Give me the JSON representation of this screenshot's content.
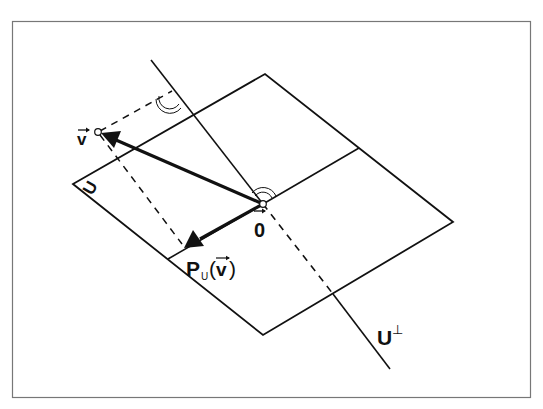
{
  "diagram": {
    "labels": {
      "v": "v",
      "zero": "0",
      "subspace": "U",
      "projection_P": "P",
      "projection_sub": "U",
      "projection_arg": "v",
      "orth_complement": "U",
      "perp_symbol": "⊥"
    },
    "colors": {
      "stroke": "#111111",
      "frame": "#777777",
      "background": "#ffffff"
    },
    "elements": [
      "frame",
      "plane U (parallelogram with midlines)",
      "line U-perp through origin",
      "vector v from origin",
      "vector P_U(v) from origin",
      "dashed projection lines",
      "right-angle arc marks"
    ]
  }
}
